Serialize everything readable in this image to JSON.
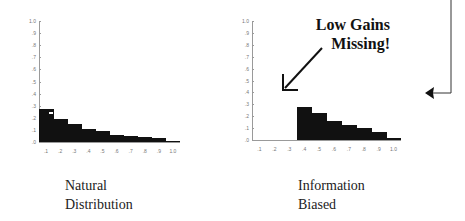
{
  "chart_data": [
    {
      "type": "bar",
      "title": "Natural Distribution",
      "categories": [
        ".1",
        ".2",
        ".3",
        ".4",
        ".5",
        ".6",
        ".7",
        ".8",
        ".9",
        "1.0"
      ],
      "values": [
        0.27,
        0.19,
        0.15,
        0.11,
        0.09,
        0.06,
        0.05,
        0.04,
        0.03,
        0.01
      ],
      "yticks": [
        ".0",
        ".1",
        ".2",
        ".3",
        ".4",
        ".5",
        ".6",
        ".7",
        ".8",
        ".9",
        "1.0"
      ],
      "xlabel": "",
      "ylabel": "",
      "ylim": [
        0,
        1.0
      ],
      "grid": false
    },
    {
      "type": "bar",
      "title": "Information Biased",
      "categories": [
        ".1",
        ".2",
        ".3",
        ".4",
        ".5",
        ".6",
        ".7",
        ".8",
        ".9",
        "1.0"
      ],
      "values": [
        0,
        0,
        0,
        0.28,
        0.23,
        0.16,
        0.13,
        0.1,
        0.07,
        0.02
      ],
      "yticks": [
        ".0",
        ".1",
        ".2",
        ".3",
        ".4",
        ".5",
        ".6",
        ".7",
        ".8",
        ".9",
        "1.0"
      ],
      "xlabel": "",
      "ylabel": "",
      "ylim": [
        0,
        1.0
      ],
      "grid": false,
      "annotation": "Low Gains Missing!"
    }
  ],
  "captions": {
    "left_line1": "Natural",
    "left_line2": "Distribution",
    "right_line1": "Information",
    "right_line2": "Biased"
  },
  "annotation": {
    "line1": "Low Gains",
    "line2": "Missing!"
  }
}
